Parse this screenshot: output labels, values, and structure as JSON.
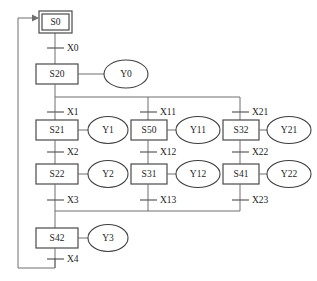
{
  "diagram": {
    "type": "sfc-parallel-branch",
    "initial_step": {
      "id": "S0",
      "label": "S0",
      "double_border": true
    },
    "steps": [
      {
        "label": "S0"
      },
      {
        "label": "S20"
      },
      {
        "label": "S21"
      },
      {
        "label": "S22"
      },
      {
        "label": "S50"
      },
      {
        "label": "S31"
      },
      {
        "label": "S32"
      },
      {
        "label": "S41"
      },
      {
        "label": "S42"
      }
    ],
    "actions": [
      {
        "label": "Y0"
      },
      {
        "label": "Y1"
      },
      {
        "label": "Y2"
      },
      {
        "label": "Y3"
      },
      {
        "label": "Y11"
      },
      {
        "label": "Y12"
      },
      {
        "label": "Y21"
      },
      {
        "label": "Y22"
      }
    ],
    "transitions": [
      {
        "label": "X0"
      },
      {
        "label": "X1"
      },
      {
        "label": "X2"
      },
      {
        "label": "X3"
      },
      {
        "label": "X4"
      },
      {
        "label": "X11"
      },
      {
        "label": "X12"
      },
      {
        "label": "X13"
      },
      {
        "label": "X21"
      },
      {
        "label": "X22"
      },
      {
        "label": "X23"
      }
    ],
    "branches": {
      "left": {
        "steps": [
          "S21",
          "S22"
        ],
        "actions": [
          "Y1",
          "Y2"
        ],
        "transitions": [
          "X1",
          "X2",
          "X3"
        ]
      },
      "middle": {
        "steps": [
          "S31",
          "S32"
        ],
        "actions": [
          "Y11",
          "Y12"
        ],
        "transitions": [
          "X11",
          "X12",
          "X13"
        ]
      },
      "right": {
        "steps": [
          "S41",
          "S42"
        ],
        "actions": [
          "Y21",
          "Y22"
        ],
        "transitions": [
          "X21",
          "X22",
          "X23"
        ]
      }
    },
    "colors": {
      "line": "#6f6f6f",
      "box_stroke": "#4a4a4a",
      "text": "#1c1c1c",
      "background": "#ffffff"
    }
  }
}
